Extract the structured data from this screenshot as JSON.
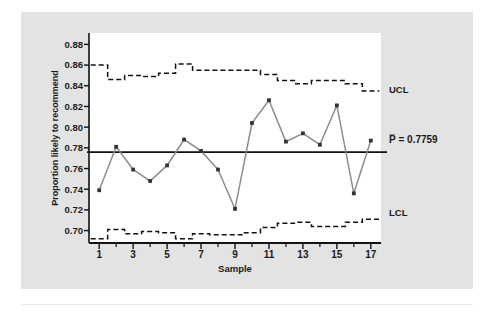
{
  "figure": {
    "background_color": "#e3e3e3",
    "plot_background_color": "#ffffff",
    "series_color": "#8c8c8c",
    "marker_color": "#333333",
    "limit_line_color": "#111111",
    "center_line_color": "#111111"
  },
  "chart_data": {
    "type": "line",
    "title": "",
    "subtitle": "",
    "xlabel": "Sample",
    "ylabel": "Proportion likely to recommend",
    "xlim": [
      0.4,
      17.6
    ],
    "ylim": [
      0.688,
      0.891
    ],
    "grid": false,
    "legend": "none",
    "x": [
      1,
      2,
      3,
      4,
      5,
      6,
      7,
      8,
      9,
      10,
      11,
      12,
      13,
      14,
      15,
      16,
      17
    ],
    "xticks": [
      1,
      3,
      5,
      7,
      9,
      11,
      13,
      15,
      17
    ],
    "xtick_labels": [
      "1",
      "3",
      "5",
      "7",
      "9",
      "11",
      "13",
      "15",
      "17"
    ],
    "xticks_minor": [
      2,
      4,
      6,
      8,
      10,
      12,
      14,
      16
    ],
    "yticks": [
      0.7,
      0.72,
      0.74,
      0.76,
      0.78,
      0.8,
      0.82,
      0.84,
      0.86,
      0.88
    ],
    "ytick_labels": [
      "0.70",
      "0.72",
      "0.74",
      "0.76",
      "0.78",
      "0.80",
      "0.82",
      "0.84",
      "0.86",
      "0.88"
    ],
    "series": [
      {
        "name": "Proportion likely to recommend",
        "style": "line-marker",
        "values": [
          0.739,
          0.781,
          0.759,
          0.748,
          0.763,
          0.788,
          0.777,
          0.759,
          0.721,
          0.804,
          0.826,
          0.786,
          0.794,
          0.783,
          0.821,
          0.736,
          0.787
        ]
      },
      {
        "name": "UCL",
        "style": "dashed-step",
        "values": [
          0.86,
          0.846,
          0.85,
          0.849,
          0.852,
          0.861,
          0.855,
          0.855,
          0.855,
          0.855,
          0.851,
          0.845,
          0.842,
          0.845,
          0.845,
          0.842,
          0.835
        ]
      },
      {
        "name": "LCL",
        "style": "dashed-step",
        "values": [
          0.692,
          0.701,
          0.697,
          0.699,
          0.698,
          0.692,
          0.697,
          0.696,
          0.696,
          0.698,
          0.703,
          0.707,
          0.708,
          0.704,
          0.704,
          0.708,
          0.711
        ]
      }
    ],
    "center_line": {
      "label": "P̅ = 0.7759",
      "value": 0.7759
    },
    "annotations": [
      {
        "name": "UCL",
        "text": "UCL",
        "value": 0.835
      },
      {
        "name": "center-line",
        "text": "P̅ = 0.7759",
        "value": 0.7759
      },
      {
        "name": "LCL",
        "text": "LCL",
        "value": 0.711
      }
    ]
  }
}
